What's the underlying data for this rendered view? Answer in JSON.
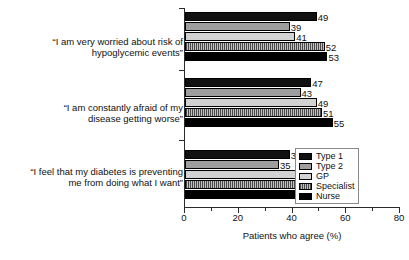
{
  "chart_data": {
    "type": "bar",
    "orientation": "horizontal",
    "title": "",
    "xlabel": "Patients who agree (%)",
    "ylabel": "",
    "xlim": [
      0,
      80
    ],
    "xticks": [
      0,
      20,
      40,
      60,
      80
    ],
    "minor_tick_step": 10,
    "grid": false,
    "legend_position": "bottom-right",
    "categories": [
      "“I am very worried about risk of\nhypoglycemic events”",
      "“I am constantly afraid of my\ndisease getting worse”",
      "“I feel that my diabetes is preventing\nme from doing what I want”"
    ],
    "series": [
      {
        "name": "Type 1",
        "values": [
          49,
          47,
          39
        ],
        "color": "#111111",
        "pattern": "solid"
      },
      {
        "name": "Type 2",
        "values": [
          39,
          43,
          35
        ],
        "color": "#9d9d9d",
        "pattern": "solid"
      },
      {
        "name": "GP",
        "values": [
          41,
          49,
          43
        ],
        "color": "#d2d2d2",
        "pattern": "solid"
      },
      {
        "name": "Specialist",
        "values": [
          52,
          51,
          49
        ],
        "color": "#8f8f8f",
        "pattern": "vertical-hatch"
      },
      {
        "name": "Nurse",
        "values": [
          53,
          55,
          47
        ],
        "color": "#000000",
        "pattern": "solid"
      }
    ],
    "value_labels": {
      "group_1": [
        "49",
        "39",
        "41",
        "52",
        "53"
      ],
      "group_2": [
        "47",
        "43",
        "49",
        "51",
        "55"
      ],
      "group_3": [
        "39",
        "35",
        "43",
        "49",
        "47"
      ]
    },
    "xtick_labels": [
      "0",
      "20",
      "40",
      "60",
      "80"
    ]
  }
}
